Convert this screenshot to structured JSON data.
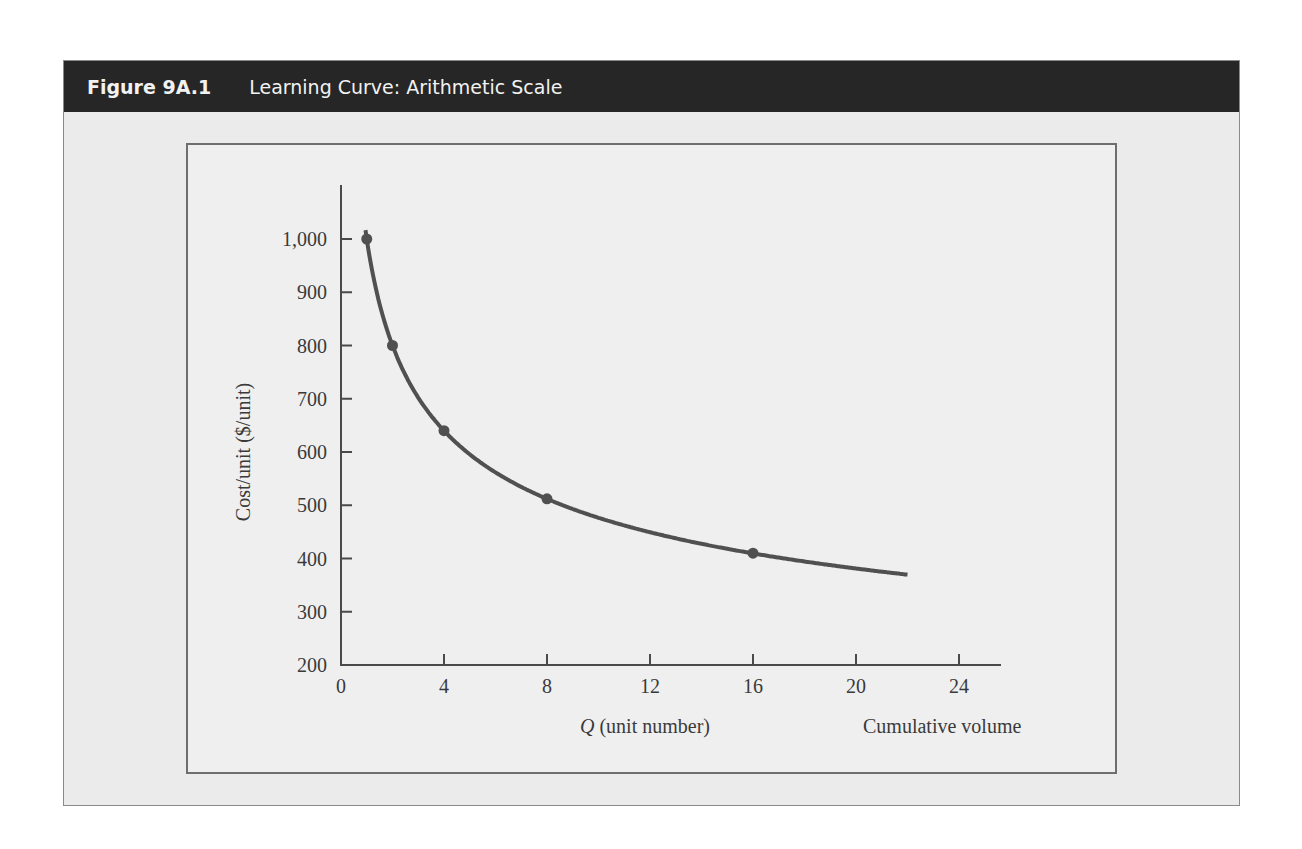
{
  "figure": {
    "number": "Figure 9A.1",
    "title": "Learning Curve: Arithmetic Scale"
  },
  "colors": {
    "header_bg": "#262626",
    "panel_bg": "#ebebeb",
    "plot_bg": "#efefef",
    "curve": "#505050",
    "axis": "#4a4a4a"
  },
  "chart_data": {
    "type": "line",
    "title": "Learning Curve: Arithmetic Scale",
    "xlabel": "Q (unit number)",
    "xlabel_italic_part": "Q",
    "xlabel_rest": " (unit number)",
    "xlabel_secondary": "Cumulative volume",
    "ylabel": "Cost/unit ($/unit)",
    "xlim": [
      0,
      25
    ],
    "ylim": [
      200,
      1000
    ],
    "x_ticks": [
      0,
      4,
      8,
      12,
      16,
      20,
      24
    ],
    "x_tick_labels": [
      "0",
      "4",
      "8",
      "12",
      "16",
      "20",
      "24"
    ],
    "y_ticks": [
      200,
      300,
      400,
      500,
      600,
      700,
      800,
      900,
      1000
    ],
    "y_tick_labels": [
      "200",
      "300",
      "400",
      "500",
      "600",
      "700",
      "800",
      "900",
      "1,000"
    ],
    "grid": false,
    "legend": null,
    "series": [
      {
        "name": "Learning curve (80%)",
        "curve_range": [
          0.95,
          22
        ],
        "marked_points": [
          {
            "x": 1,
            "y": 1000
          },
          {
            "x": 2,
            "y": 800
          },
          {
            "x": 4,
            "y": 640
          },
          {
            "x": 8,
            "y": 512
          },
          {
            "x": 16,
            "y": 410
          }
        ]
      }
    ]
  }
}
